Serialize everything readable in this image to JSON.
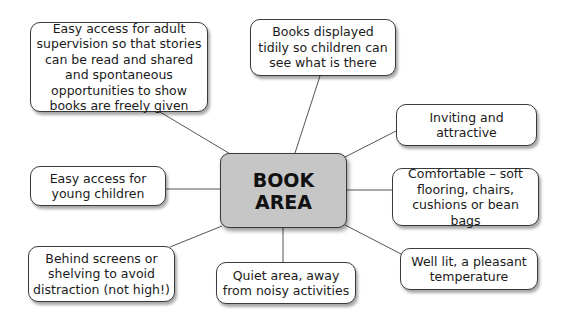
{
  "center": {
    "line1": "BOOK",
    "line2": "AREA",
    "fill": "#c6c6c6"
  },
  "nodes": [
    {
      "id": "adult-supervision",
      "text": "Easy access for adult supervision so that stories can be read and shared and spontaneous opportunities to show books are freely given"
    },
    {
      "id": "displayed-tidily",
      "text": "Books displayed tidily so children can see what is there"
    },
    {
      "id": "inviting",
      "text": "Inviting and attractive"
    },
    {
      "id": "comfortable",
      "text": "Comfortable – soft flooring, chairs, cushions or bean bags"
    },
    {
      "id": "well-lit",
      "text": "Well lit, a pleasant temperature"
    },
    {
      "id": "quiet-area",
      "text": "Quiet area, away from noisy activities"
    },
    {
      "id": "behind-screens",
      "text": "Behind screens or shelving to avoid distraction (not high!)"
    },
    {
      "id": "young-children",
      "text": "Easy access for young children"
    }
  ]
}
